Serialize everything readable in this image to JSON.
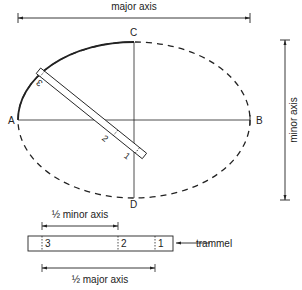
{
  "diagram": {
    "dimension_labels": {
      "major_axis": "major axis",
      "minor_axis": "minor axis",
      "half_minor_axis": "½ minor axis",
      "half_major_axis": "½ major axis"
    },
    "points": {
      "A": "A",
      "B": "B",
      "C": "C",
      "D": "D"
    },
    "trammel_marks": {
      "one": "1",
      "two": "2",
      "three": "3"
    },
    "callout": {
      "trammel": "trammel"
    },
    "colors": {
      "ink": "#222222",
      "background": "#ffffff"
    }
  }
}
